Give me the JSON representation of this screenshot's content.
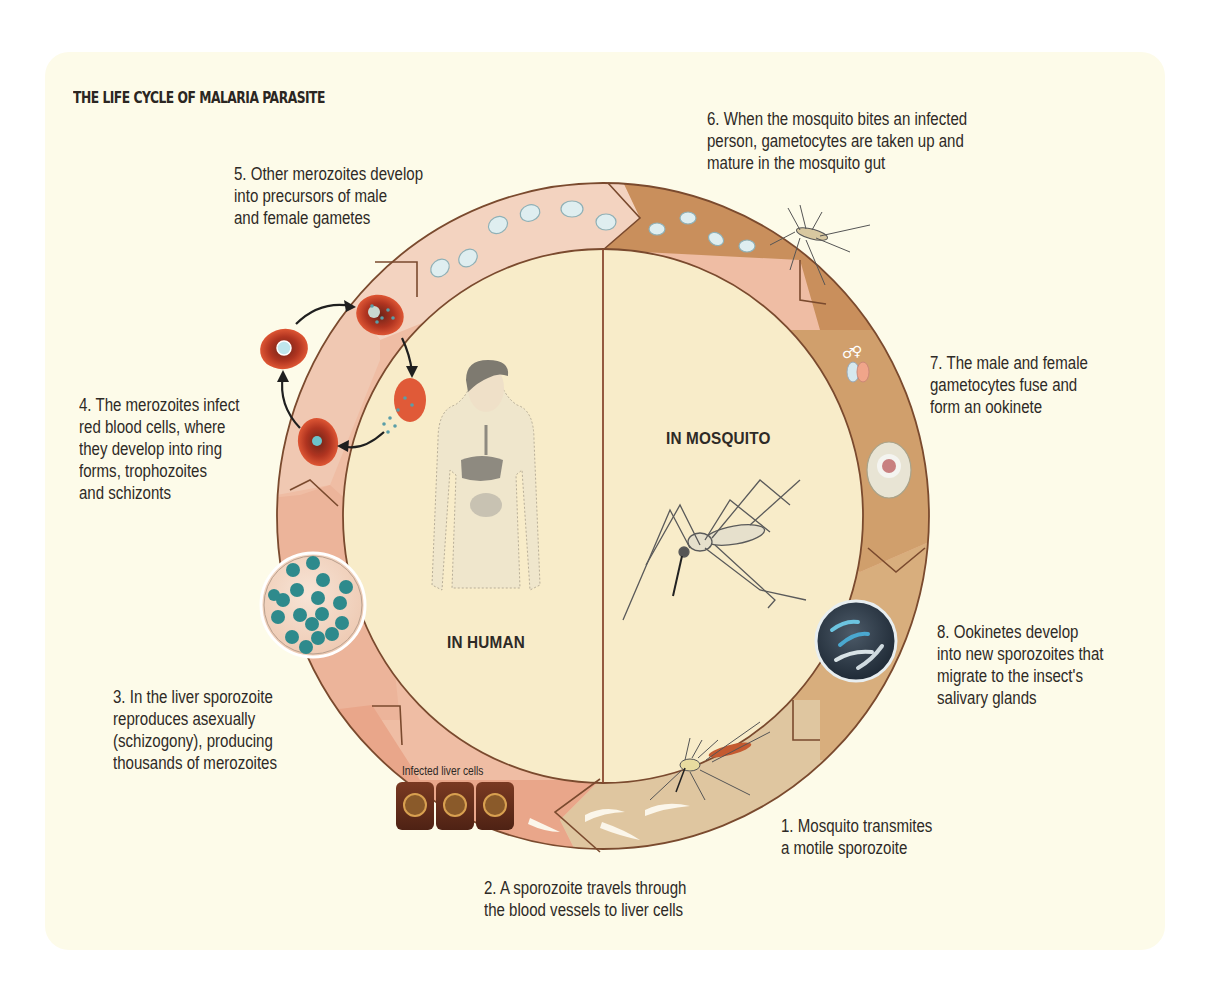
{
  "title": "THE LIFE CYCLE OF MALARIA PARASITE",
  "zones": {
    "human": "IN HUMAN",
    "mosquito": "IN MOSQUITO"
  },
  "steps": [
    {
      "number": 1,
      "text": "1. Mosquito transmites\na motile sporozoite"
    },
    {
      "number": 2,
      "text": "2. A sporozoite travels through\nthe blood vessels to liver cells"
    },
    {
      "number": 3,
      "text": "3. In the liver sporozoite\nreproduces asexually\n(schizogony), producing\nthousands of merozoites"
    },
    {
      "number": 4,
      "text": "4. The merozoites infect\nred blood cells, where\nthey develop into ring\nforms, trophozoites\nand schizonts"
    },
    {
      "number": 5,
      "text": "5. Other merozoites develop\ninto precursors of male\nand female gametes"
    },
    {
      "number": 6,
      "text": "6. When the mosquito bites an infected\nperson, gametocytes are taken up and\nmature in the mosquito gut"
    },
    {
      "number": 7,
      "text": "7. The male and female\ngametocytes fuse and\nform an ookinete"
    },
    {
      "number": 8,
      "text": "8. Ookinetes develop\ninto new sporozoites that\nmigrate to the insect's\nsalivary glands"
    }
  ],
  "labels": {
    "infected_liver_cells": "Infected liver cells",
    "male_symbol": "♂",
    "female_symbol": "♀"
  },
  "icons": [
    "human-body-icon",
    "mosquito-icon",
    "red-blood-cell-icon",
    "liver-cell-icon",
    "merozoite-cluster-icon",
    "gametocyte-icon",
    "ookinete-icon",
    "sporozoite-icon",
    "cycle-arrow-icon"
  ],
  "colors": {
    "panel_bg": "#fdfbe9",
    "center_fill": "#f7ebcb",
    "ring_human_light": "#f3d3c0",
    "ring_human_mid": "#efbda4",
    "ring_human_dark": "#e9a285",
    "ring_mosquito_dark": "#c98f5c",
    "ring_mosquito_mid": "#d5a573",
    "ring_mosquito_light": "#dcc09a",
    "outline": "#7a4a2e",
    "text": "#2e2a26",
    "rbc": "#d4472a"
  }
}
